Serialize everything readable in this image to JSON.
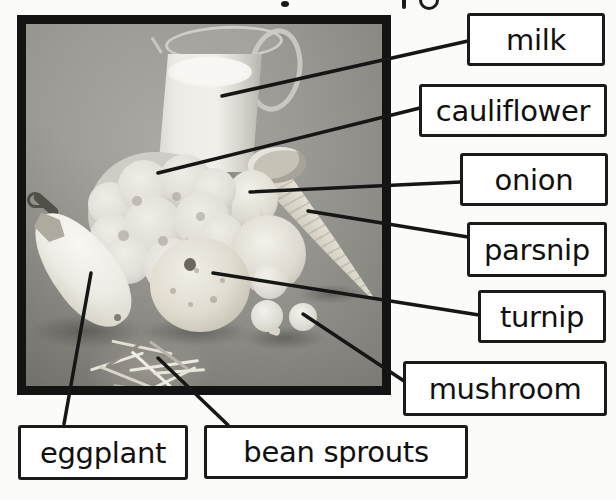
{
  "page": {
    "type": "picture-dictionary-diagram",
    "cropped_title_descenders": 3
  },
  "photo": {
    "description_items": [
      "milk-pitcher",
      "cauliflower",
      "onion-small",
      "onion-large",
      "parsnip",
      "turnip",
      "mushrooms",
      "eggplant",
      "bean-sprouts-pile"
    ]
  },
  "labels": [
    {
      "id": "milk",
      "text": "milk"
    },
    {
      "id": "cauliflower",
      "text": "cauliflower"
    },
    {
      "id": "onion",
      "text": "onion"
    },
    {
      "id": "parsnip",
      "text": "parsnip"
    },
    {
      "id": "turnip",
      "text": "turnip"
    },
    {
      "id": "mushroom",
      "text": "mushroom"
    },
    {
      "id": "eggplant",
      "text": "eggplant"
    },
    {
      "id": "bean_sprouts",
      "text": "bean sprouts"
    }
  ],
  "colors": {
    "page_bg": "#fbfbf9",
    "line": "#161616",
    "box_border": "#1a1a1a",
    "box_bg": "#ffffff",
    "label_text": "#101010",
    "photo_border": "#131313",
    "photo_bg": "#96948f"
  }
}
